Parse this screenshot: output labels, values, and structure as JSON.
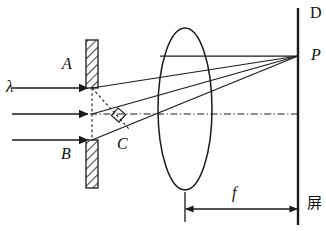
{
  "figure": {
    "background_color": "#ffffff",
    "stroke_color": "#1a1a1a",
    "hatch_color": "#555555",
    "width": 326,
    "height": 231
  },
  "labels": {
    "wavelength": "λ",
    "upper_blade": "A",
    "lower_blade": "B",
    "slit_point": "C",
    "screen_top": "D",
    "focus_point": "P",
    "focal_length": "f",
    "screen_cjk": "屏"
  },
  "components": {
    "incident_rays": {
      "name": "incident-plane-wave",
      "count": 3,
      "y_values": [
        88,
        114,
        140
      ],
      "x_start": 12,
      "x_end": 90,
      "direction": "left-to-right"
    },
    "slit": {
      "name": "single-slit-aperture",
      "upper_blade": {
        "x": 86,
        "y": 40,
        "width": 12,
        "height": 48,
        "hatched": true
      },
      "lower_blade": {
        "x": 86,
        "y": 140,
        "width": 12,
        "height": 48,
        "hatched": true
      },
      "gap_center_y": 114,
      "aperture_x": 92
    },
    "lens": {
      "name": "converging-lens",
      "center_x": 185,
      "center_y": 109,
      "rx": 27,
      "ry": 81
    },
    "screen": {
      "name": "observation-screen",
      "x": 298,
      "y_top": 8,
      "y_bottom": 225
    },
    "optical_axis": {
      "name": "optical-axis",
      "y": 114,
      "x_start": 90,
      "x_end": 298,
      "style": "dash-dot"
    },
    "diffracted_rays": {
      "name": "diffracted-rays-to-P",
      "focus_x": 298,
      "focus_y": 56,
      "origins": [
        {
          "x": 92,
          "y": 88
        },
        {
          "x": 92,
          "y": 114
        },
        {
          "x": 92,
          "y": 140
        }
      ]
    },
    "construction": {
      "name": "path-difference-construction",
      "dashed_vertical": {
        "x": 92,
        "y_top": 88,
        "y_bottom": 140
      },
      "dashed_diagonal": {
        "x1": 92,
        "y1": 88,
        "x2": 128,
        "y2": 128
      },
      "right_angle_marker": {
        "x": 122,
        "y": 110,
        "size": 10
      }
    },
    "focal_dimension": {
      "name": "focal-length-dimension",
      "y": 209,
      "x_start": 185,
      "x_end": 298,
      "tick_top_left": 192,
      "tick_top_right": 8
    }
  }
}
